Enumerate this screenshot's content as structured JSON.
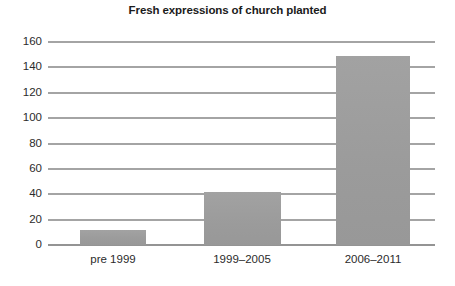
{
  "chart_data": {
    "type": "bar",
    "title": "Fresh expressions of church planted",
    "xlabel": "",
    "ylabel": "",
    "categories": [
      "pre 1999",
      "1999–2005",
      "2006–2011"
    ],
    "values": [
      12,
      42,
      149
    ],
    "ylim": [
      0,
      160
    ],
    "yticks": [
      0,
      20,
      40,
      60,
      80,
      100,
      120,
      140,
      160
    ],
    "ytick_labels": [
      "0",
      "20",
      "40",
      "60",
      "80",
      "100",
      "120",
      "140",
      "160"
    ],
    "grid": true,
    "legend": null,
    "colors": {
      "bar_fill": "#9d9d9d",
      "gridline": "#4a4a4a",
      "baseline": "#2b2b2b",
      "text": "#2b2b2b",
      "title_text": "#1b1b1b",
      "background": "#ffffff"
    }
  }
}
